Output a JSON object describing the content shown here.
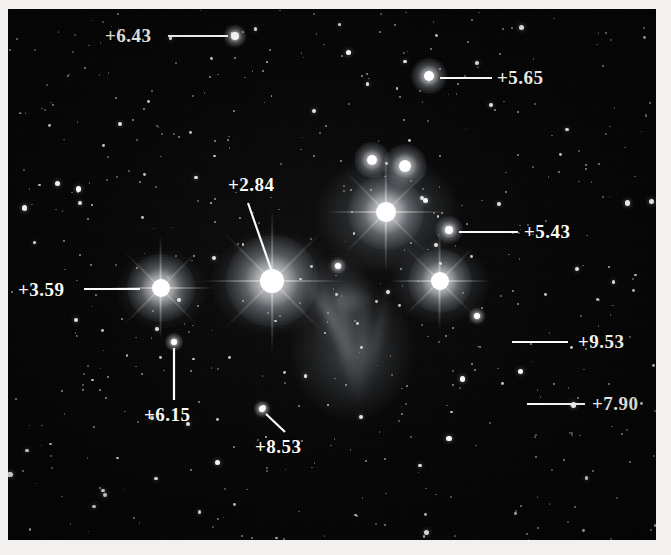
{
  "figure": {
    "kind": "astronomical-photograph",
    "plate_background_color": "#050505",
    "annotation_color": "#fbfbf7",
    "paper_color": "#f2f1ef"
  },
  "annotations": [
    {
      "id": "mag-6-43",
      "label": "+6.43",
      "label_x": 105,
      "label_y": 26,
      "line": {
        "x1": 168,
        "y1": 36,
        "x2": 228,
        "y2": 36
      },
      "target": {
        "x": 235,
        "y": 36,
        "r": 4.0
      }
    },
    {
      "id": "mag-5-65",
      "label": "+5.65",
      "label_x": 497,
      "label_y": 68,
      "line": {
        "x1": 440,
        "y1": 78,
        "x2": 492,
        "y2": 78
      },
      "target": {
        "x": 429,
        "y": 76,
        "r": 5.0
      }
    },
    {
      "id": "mag-2-84",
      "label": "+2.84",
      "label_x": 228,
      "label_y": 175,
      "line": {
        "x1": 248,
        "y1": 203,
        "x2": 272,
        "y2": 272
      },
      "target": {
        "x": 272,
        "y": 281,
        "r": 10.0
      }
    },
    {
      "id": "mag-5-43",
      "label": "+5.43",
      "label_x": 524,
      "label_y": 222,
      "line": {
        "x1": 459,
        "y1": 232,
        "x2": 518,
        "y2": 232
      },
      "target": {
        "x": 449,
        "y": 230,
        "r": 4.5
      }
    },
    {
      "id": "mag-3-59",
      "label": "+3.59",
      "label_x": 18,
      "label_y": 280,
      "line": {
        "x1": 84,
        "y1": 289,
        "x2": 140,
        "y2": 289
      },
      "target": {
        "x": 161,
        "y": 288,
        "r": 8.0
      }
    },
    {
      "id": "mag-9-53",
      "label": "+9.53",
      "label_x": 578,
      "label_y": 332,
      "line": {
        "x1": 512,
        "y1": 342,
        "x2": 568,
        "y2": 342
      },
      "target": {
        "x": 572,
        "y": 341,
        "r": 2.0
      }
    },
    {
      "id": "mag-7-90",
      "label": "+7.90",
      "label_x": 592,
      "label_y": 394,
      "line": {
        "x1": 527,
        "y1": 404,
        "x2": 585,
        "y2": 404
      },
      "target": {
        "x": 590,
        "y": 403,
        "r": 2.2
      }
    },
    {
      "id": "mag-6-15",
      "label": "+6.15",
      "label_x": 144,
      "label_y": 405,
      "line": {
        "x1": 174,
        "y1": 400,
        "x2": 174,
        "y2": 348
      },
      "target": {
        "x": 174,
        "y": 342,
        "r": 3.5
      }
    },
    {
      "id": "mag-8-53",
      "label": "+8.53",
      "label_x": 255,
      "label_y": 437,
      "line": {
        "x1": 285,
        "y1": 432,
        "x2": 266,
        "y2": 414
      },
      "target": {
        "x": 262,
        "y": 409,
        "r": 2.6
      }
    }
  ],
  "bright_stars": [
    {
      "x": 272,
      "y": 281,
      "r": 12,
      "glow": 46,
      "spikes": true
    },
    {
      "x": 161,
      "y": 288,
      "r": 9,
      "glow": 34,
      "spikes": true
    },
    {
      "x": 386,
      "y": 212,
      "r": 10,
      "glow": 38,
      "spikes": true
    },
    {
      "x": 440,
      "y": 281,
      "r": 9,
      "glow": 32,
      "spikes": true
    },
    {
      "x": 405,
      "y": 166,
      "r": 6,
      "glow": 22,
      "spikes": false
    },
    {
      "x": 372,
      "y": 160,
      "r": 5,
      "glow": 18,
      "spikes": false
    },
    {
      "x": 429,
      "y": 76,
      "r": 5,
      "glow": 18,
      "spikes": false
    },
    {
      "x": 449,
      "y": 230,
      "r": 4,
      "glow": 14,
      "spikes": false
    },
    {
      "x": 235,
      "y": 36,
      "r": 4,
      "glow": 11,
      "spikes": false
    },
    {
      "x": 174,
      "y": 342,
      "r": 3,
      "glow": 9,
      "spikes": false
    },
    {
      "x": 262,
      "y": 409,
      "r": 3,
      "glow": 8,
      "spikes": false
    },
    {
      "x": 338,
      "y": 266,
      "r": 3,
      "glow": 8,
      "spikes": false
    },
    {
      "x": 477,
      "y": 316,
      "r": 3,
      "glow": 8,
      "spikes": false
    }
  ],
  "nebulosity": [
    {
      "x": 272,
      "y": 283,
      "rx": 62,
      "ry": 52,
      "opacity": 0.3
    },
    {
      "x": 388,
      "y": 214,
      "rx": 72,
      "ry": 60,
      "opacity": 0.3
    },
    {
      "x": 440,
      "y": 283,
      "rx": 50,
      "ry": 42,
      "opacity": 0.26
    },
    {
      "x": 352,
      "y": 350,
      "rx": 62,
      "ry": 72,
      "opacity": 0.24
    },
    {
      "x": 162,
      "y": 289,
      "rx": 46,
      "ry": 40,
      "opacity": 0.22
    },
    {
      "x": 340,
      "y": 300,
      "rx": 34,
      "ry": 48,
      "opacity": 0.2
    }
  ],
  "field_star_count": 520
}
